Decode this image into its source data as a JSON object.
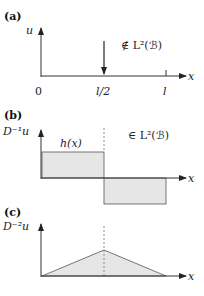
{
  "panels": [
    {
      "id": "a",
      "label": "(a)",
      "y_axis_label": "u",
      "x_axis_label": "x",
      "x_ticks": [
        "0",
        "l/2",
        "l"
      ],
      "annotation": "∉ L²(ℬ)"
    },
    {
      "id": "b",
      "label": "(b)",
      "y_axis_label": "D⁻¹u",
      "x_axis_label": "x",
      "function_label": "h(x)",
      "annotation": "∈ L²(ℬ)"
    },
    {
      "id": "c",
      "label": "(c)",
      "y_axis_label": "D⁻²u",
      "x_axis_label": "x"
    }
  ],
  "colors": {
    "line": "#333333",
    "fill": "#e6e6e6",
    "dashed": "#666666"
  }
}
